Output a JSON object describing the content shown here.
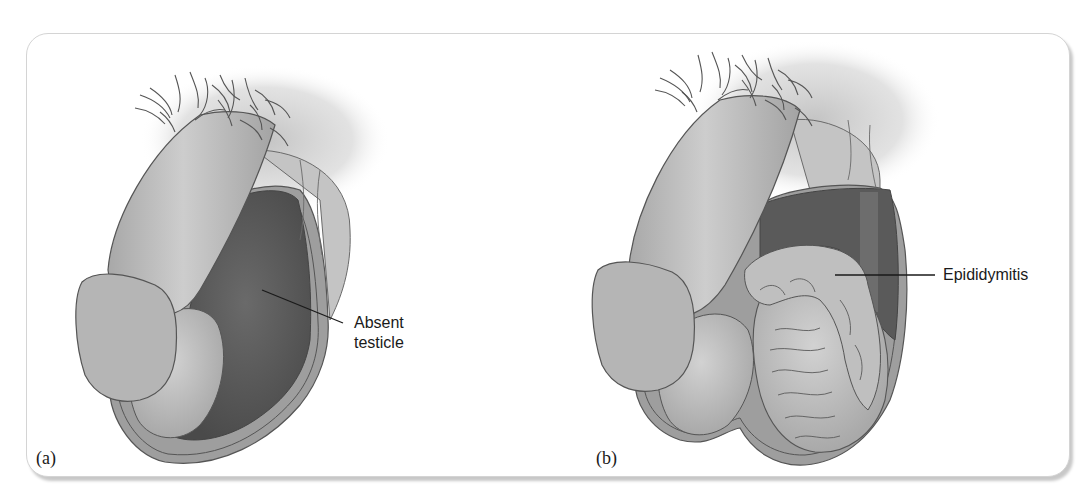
{
  "figure": {
    "panels": [
      {
        "id": "a",
        "label": "(a)",
        "callout": {
          "line1": "Absent",
          "line2": "testicle"
        }
      },
      {
        "id": "b",
        "label": "(b)",
        "callout": {
          "text": "Epididymitis"
        }
      }
    ],
    "colors": {
      "skin_light": "#c9c9c9",
      "skin_mid": "#b3b3b3",
      "skin_dark": "#8f8f8f",
      "cavity": "#5e5e5e",
      "outline": "#555555",
      "frame_border": "#d4d4d4",
      "text": "#1a1a1a"
    }
  }
}
